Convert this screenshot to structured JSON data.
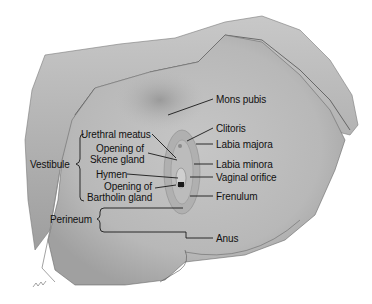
{
  "diagram": {
    "type": "anatomical-illustration",
    "colors": {
      "background": "#ffffff",
      "skin": "#bdbdbd",
      "drape": "#a9a9a9",
      "line": "#1a1a1a"
    },
    "labels_right": [
      {
        "id": "mons-pubis",
        "text": "Mons pubis"
      },
      {
        "id": "clitoris",
        "text": "Clitoris"
      },
      {
        "id": "labia-majora",
        "text": "Labia majora"
      },
      {
        "id": "labia-minora",
        "text": "Labia minora"
      },
      {
        "id": "vaginal-orifice",
        "text": "Vaginal orifice"
      },
      {
        "id": "frenulum",
        "text": "Frenulum"
      },
      {
        "id": "anus",
        "text": "Anus"
      }
    ],
    "labels_left": [
      {
        "id": "urethral-meatus",
        "text": "Urethral meatus"
      },
      {
        "id": "skene-gland",
        "line1": "Opening of",
        "line2": "Skene gland"
      },
      {
        "id": "hymen",
        "text": "Hymen"
      },
      {
        "id": "bartholin-gland",
        "line1": "Opening of",
        "line2": "Bartholin gland"
      }
    ],
    "groups": [
      {
        "id": "vestibule",
        "text": "Vestibule"
      },
      {
        "id": "perineum",
        "text": "Perineum"
      }
    ]
  }
}
